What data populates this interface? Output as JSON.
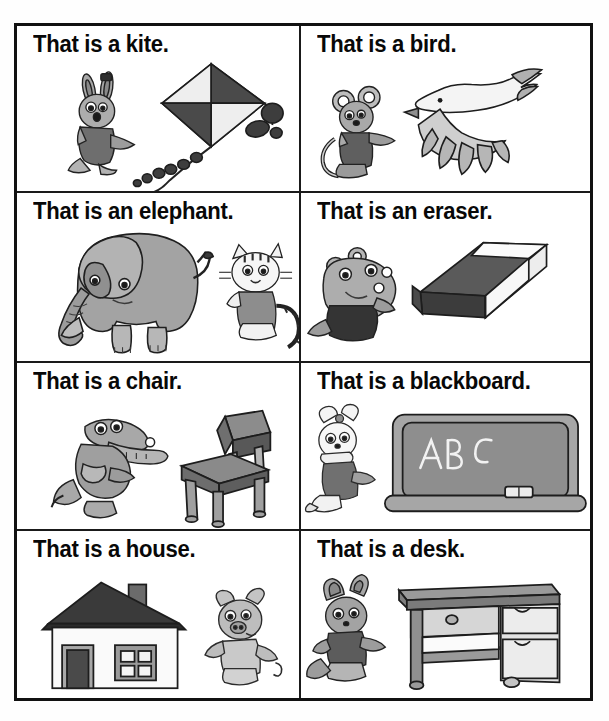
{
  "worksheet": {
    "layout": {
      "columns": 2,
      "rows": 4
    },
    "palette": {
      "ink": "#1a1a1a",
      "paper": "#ffffff",
      "mid_gray": "#9a9a9a",
      "light_gray": "#c9c9c9",
      "dark_gray": "#5a5a5a",
      "near_black": "#2b2b2b"
    },
    "cells": [
      {
        "id": "kite",
        "caption": "That is a kite.",
        "object": "kite",
        "character": "rabbit",
        "object_icon": "kite-icon",
        "character_icon": "rabbit-icon"
      },
      {
        "id": "bird",
        "caption": "That is a bird.",
        "object": "bird",
        "character": "mouse",
        "object_icon": "bird-icon",
        "character_icon": "mouse-icon"
      },
      {
        "id": "elephant",
        "caption": "That is an elephant.",
        "object": "elephant",
        "character": "cat",
        "object_icon": "elephant-icon",
        "character_icon": "cat-icon"
      },
      {
        "id": "eraser",
        "caption": "That is an eraser.",
        "object": "eraser",
        "character": "hippo",
        "object_icon": "eraser-icon",
        "character_icon": "hippo-icon"
      },
      {
        "id": "chair",
        "caption": "That is a chair.",
        "object": "chair",
        "character": "crocodile",
        "object_icon": "chair-icon",
        "character_icon": "crocodile-icon"
      },
      {
        "id": "blackboard",
        "caption": "That is a blackboard.",
        "object": "blackboard",
        "character": "bunny-with-bow",
        "object_icon": "blackboard-icon",
        "character_icon": "bunny-icon",
        "board_text": "ABC"
      },
      {
        "id": "house",
        "caption": "That is a house.",
        "object": "house",
        "character": "pig",
        "object_icon": "house-icon",
        "character_icon": "pig-icon"
      },
      {
        "id": "desk",
        "caption": "That is a desk.",
        "object": "desk",
        "character": "fox",
        "object_icon": "desk-icon",
        "character_icon": "fox-icon"
      }
    ]
  }
}
